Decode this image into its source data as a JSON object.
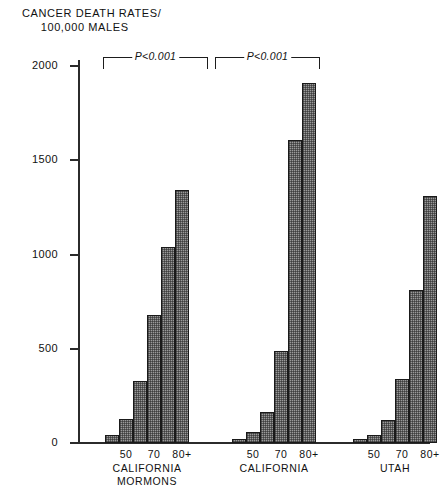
{
  "chart_data": {
    "type": "bar",
    "title": "CANCER DEATH RATES/ 100,000 MALES",
    "title_line1": "CANCER DEATH RATES/",
    "title_line2": "100,000 MALES",
    "xlabel": "AGE IN YEARS",
    "ylabel": "",
    "ylim": [
      0,
      2000
    ],
    "yticks": [
      0,
      500,
      1000,
      1500,
      2000
    ],
    "ytick_labels": [
      "0",
      "500",
      "1000",
      "1500",
      "2000"
    ],
    "grid": false,
    "legend": "none",
    "age_categories": [
      "40",
      "50",
      "60",
      "70",
      "80",
      "80+"
    ],
    "age_tick_labels": [
      "50",
      "70",
      "80+"
    ],
    "groups": [
      {
        "name": "CALIFORNIA MORMONS",
        "name_line1": "CALIFORNIA",
        "name_line2": "MORMONS",
        "values": [
          45,
          125,
          330,
          680,
          1040,
          1340
        ]
      },
      {
        "name": "CALIFORNIA",
        "name_line1": "CALIFORNIA",
        "name_line2": "",
        "values": [
          20,
          60,
          165,
          490,
          1610,
          1910
        ]
      },
      {
        "name": "UTAH",
        "name_line1": "UTAH",
        "name_line2": "",
        "values": [
          20,
          40,
          120,
          340,
          810,
          1310
        ]
      }
    ],
    "annotations": [
      {
        "text": "P<0.001",
        "between": [
          "CALIFORNIA MORMONS",
          "CALIFORNIA"
        ]
      },
      {
        "text": "P<0.001",
        "between": [
          "CALIFORNIA",
          "UTAH"
        ]
      }
    ],
    "colors": {
      "bar_fill": "#9a9a9a",
      "bar_edge": "#1a1a1a",
      "axis": "#2b2b2b",
      "text": "#111111",
      "background": "#ffffff"
    }
  }
}
